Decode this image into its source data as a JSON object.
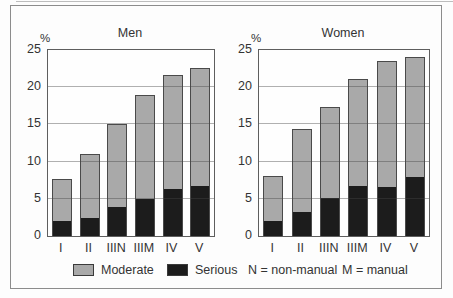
{
  "figure": {
    "legend": {
      "moderate_label": "Moderate",
      "serious_label": "Serious",
      "note_n": "N = non-manual",
      "note_m": "M = manual"
    },
    "colors": {
      "moderate": "#a9a9a9",
      "serious": "#1c1c1c",
      "frame": "#8c8c8c",
      "axis": "#5e5e5e",
      "grid": "#9a9a9a",
      "text": "#333333",
      "background": "#fdfdfd"
    }
  },
  "chart_data": [
    {
      "type": "bar",
      "stacked": true,
      "title": "Men",
      "ylabel": "%",
      "xlabel": "",
      "ylim": [
        0,
        25
      ],
      "yticks": [
        0,
        5,
        10,
        15,
        20,
        25
      ],
      "grid": true,
      "legend_position": "bottom",
      "categories": [
        "I",
        "II",
        "IIIN",
        "IIIM",
        "IV",
        "V"
      ],
      "series": [
        {
          "name": "Serious",
          "color": "#1c1c1c",
          "values": [
            2.0,
            2.5,
            4.0,
            5.0,
            6.3,
            6.8
          ]
        },
        {
          "name": "Moderate",
          "color": "#a9a9a9",
          "values": [
            5.6,
            8.5,
            11.0,
            14.0,
            15.4,
            15.8
          ]
        }
      ],
      "stacked_totals": [
        7.6,
        11.0,
        15.0,
        19.0,
        21.7,
        22.6
      ]
    },
    {
      "type": "bar",
      "stacked": true,
      "title": "Women",
      "ylabel": "%",
      "xlabel": "",
      "ylim": [
        0,
        25
      ],
      "yticks": [
        0,
        5,
        10,
        15,
        20,
        25
      ],
      "grid": true,
      "legend_position": "bottom",
      "categories": [
        "I",
        "II",
        "IIIN",
        "IIIM",
        "IV",
        "V"
      ],
      "series": [
        {
          "name": "Serious",
          "color": "#1c1c1c",
          "values": [
            2.1,
            3.3,
            5.2,
            6.8,
            6.6,
            8.0
          ]
        },
        {
          "name": "Moderate",
          "color": "#a9a9a9",
          "values": [
            5.9,
            11.1,
            12.1,
            14.3,
            16.9,
            16.0
          ]
        }
      ],
      "stacked_totals": [
        8.0,
        14.4,
        17.3,
        21.1,
        23.5,
        24.0
      ]
    }
  ]
}
